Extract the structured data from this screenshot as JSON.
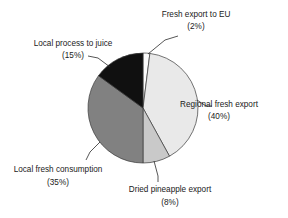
{
  "chart_data": {
    "type": "pie",
    "title": "",
    "subtitle": "",
    "xlabel": "",
    "ylabel": "",
    "legend_position": "none",
    "grid": false,
    "value_unit": "percent",
    "total": 100,
    "categories": [
      "Fresh export to EU",
      "Regional fresh export",
      "Dried pineapple export",
      "Local fresh consumption",
      "Local process to juice"
    ],
    "values": [
      2,
      40,
      8,
      35,
      15
    ],
    "slices": [
      {
        "label": "Fresh export to EU",
        "percent_label": "(2%)",
        "value": 2,
        "color": "#fdfdfd",
        "start_angle": 0,
        "end_angle": 7.2,
        "label_x": 196,
        "label_y": 17,
        "pct_x": 196,
        "pct_y": 29,
        "label_anchor": "middle",
        "leader": [
          148,
          54,
          165,
          40,
          178,
          36
        ]
      },
      {
        "label": "Regional fresh export",
        "percent_label": "(40%)",
        "value": 40,
        "color": "#e9e9e9",
        "start_angle": 7.2,
        "end_angle": 151.2,
        "label_x": 219,
        "label_y": 107,
        "pct_x": 219,
        "pct_y": 119,
        "label_anchor": "middle",
        "leader": [
          197,
          100,
          206,
          106,
          212,
          106
        ]
      },
      {
        "label": "Dried pineapple export",
        "percent_label": "(8%)",
        "value": 8,
        "color": "#c9c9c9",
        "start_angle": 151.2,
        "end_angle": 180.0,
        "label_x": 170,
        "label_y": 192,
        "pct_x": 170,
        "pct_y": 205,
        "label_anchor": "middle",
        "leader": [
          154,
          161,
          158,
          176,
          158,
          182
        ]
      },
      {
        "label": "Local fresh consumption",
        "percent_label": "(35%)",
        "value": 35,
        "color": "#818181",
        "start_angle": 180.0,
        "end_angle": 306.0,
        "label_x": 58,
        "label_y": 172,
        "pct_x": 58,
        "pct_y": 185,
        "label_anchor": "middle",
        "leader": [
          100,
          142,
          90,
          152,
          86,
          160
        ]
      },
      {
        "label": "Local process to juice",
        "percent_label": "(15%)",
        "value": 15,
        "color": "#101010",
        "start_angle": 306.0,
        "end_angle": 360.0,
        "label_x": 73,
        "label_y": 46,
        "pct_x": 73,
        "pct_y": 58,
        "label_anchor": "middle",
        "leader": [
          110,
          67,
          98,
          58,
          88,
          56
        ]
      }
    ],
    "geometry": {
      "center_x": 143,
      "center_y": 108,
      "radius": 55
    }
  }
}
